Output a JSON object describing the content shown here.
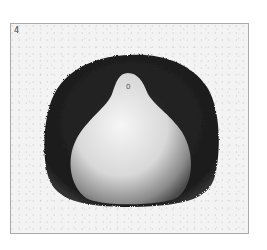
{
  "figure": {
    "label": "4",
    "marker_glyph": "0"
  },
  "colors": {
    "background": "#f3f3f3",
    "halo": "#1e1e1e",
    "body_light": "#f2f2f2",
    "body_shadow": "#5a5a5a",
    "frame": "#aaaaaa"
  }
}
